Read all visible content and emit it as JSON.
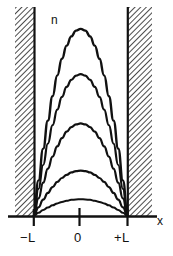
{
  "figure": {
    "kind": "physics-diagram",
    "background_color": "#ffffff",
    "ink_color": "#111111",
    "hatch_color": "#2b2b2b"
  },
  "labels": {
    "vertical_axis": "n",
    "horizontal_axis": "x",
    "tick_left": "−L",
    "tick_center": "0",
    "tick_right": "+L"
  },
  "walls": {
    "left": {
      "name": "left-potential-wall",
      "hatch_x_start": 15,
      "hatch_x_end": 34,
      "hatch_y_top": 7,
      "hatch_y_bottom": 216,
      "edge_x": 34
    },
    "right": {
      "name": "right-potential-wall",
      "hatch_x_start": 128,
      "hatch_x_end": 152,
      "hatch_y_top": 7,
      "hatch_y_bottom": 216,
      "edge_x": 128
    }
  },
  "chart_data": {
    "type": "line",
    "title": "",
    "subtitle": "",
    "xlabel": "x",
    "ylabel": "n",
    "grid": false,
    "legend": null,
    "xlim": [
      -1.55,
      1.1
    ],
    "ylim": [
      0,
      1.0
    ],
    "xticks": [
      -1,
      0,
      1
    ],
    "xticklabels": [
      "−L",
      "0",
      "+L"
    ],
    "yticks": [],
    "yticklabels": [],
    "annotations": [
      {
        "text": "n",
        "x": -0.62,
        "y": 0.96,
        "name": "curve-family-label"
      },
      {
        "text": "x",
        "x": 1.04,
        "y": 0.02,
        "name": "x-axis-label"
      }
    ],
    "x": [
      -1.0,
      -0.9,
      -0.8,
      -0.7,
      -0.6,
      -0.5,
      -0.4,
      -0.3,
      -0.2,
      -0.1,
      0.0,
      0.1,
      0.2,
      0.3,
      0.4,
      0.5,
      0.6,
      0.7,
      0.8,
      0.9,
      1.0
    ],
    "series": [
      {
        "name": "n = 5",
        "peak_value": 0.95,
        "peak_y_px": 19,
        "values": [
          0.0,
          0.181,
          0.342,
          0.484,
          0.608,
          0.713,
          0.798,
          0.865,
          0.912,
          0.941,
          0.95,
          0.941,
          0.912,
          0.865,
          0.798,
          0.713,
          0.608,
          0.484,
          0.342,
          0.181,
          0.0
        ]
      },
      {
        "name": "n = 4",
        "peak_value": 0.72,
        "peak_y_px": 69,
        "values": [
          0.0,
          0.137,
          0.259,
          0.367,
          0.461,
          0.54,
          0.605,
          0.655,
          0.691,
          0.713,
          0.72,
          0.713,
          0.691,
          0.655,
          0.605,
          0.54,
          0.461,
          0.367,
          0.259,
          0.137,
          0.0
        ]
      },
      {
        "name": "n = 3",
        "peak_value": 0.47,
        "peak_y_px": 119,
        "values": [
          0.0,
          0.089,
          0.169,
          0.24,
          0.301,
          0.353,
          0.395,
          0.428,
          0.451,
          0.465,
          0.47,
          0.465,
          0.451,
          0.428,
          0.395,
          0.353,
          0.301,
          0.24,
          0.169,
          0.089,
          0.0
        ]
      },
      {
        "name": "n = 2",
        "peak_value": 0.23,
        "peak_y_px": 170,
        "values": [
          0.0,
          0.044,
          0.083,
          0.117,
          0.147,
          0.173,
          0.193,
          0.209,
          0.221,
          0.228,
          0.23,
          0.228,
          0.221,
          0.209,
          0.193,
          0.173,
          0.147,
          0.117,
          0.083,
          0.044,
          0.0
        ]
      },
      {
        "name": "n = 1",
        "peak_value": 0.085,
        "peak_y_px": 198,
        "values": [
          0.0,
          0.016,
          0.031,
          0.043,
          0.054,
          0.064,
          0.071,
          0.077,
          0.082,
          0.084,
          0.085,
          0.084,
          0.082,
          0.077,
          0.071,
          0.064,
          0.054,
          0.043,
          0.031,
          0.016,
          0.0
        ]
      }
    ]
  }
}
